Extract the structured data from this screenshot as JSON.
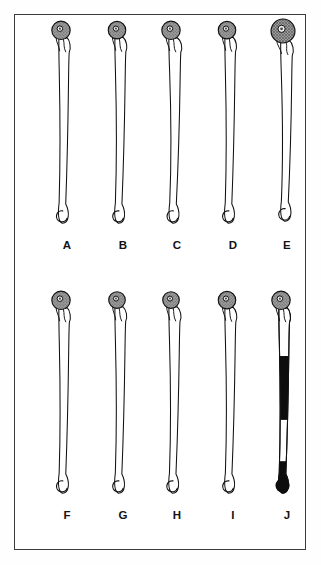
{
  "figure": {
    "kind": "comparative-anatomy-plate",
    "background_color": "#ffffff",
    "frame_color": "#3a3a3a",
    "ink_color": "#111111",
    "head_fill_color": "#9a9a9a",
    "bone_fill_color": "#ffffff",
    "black_fill_color": "#0d0d0d",
    "rows": 2,
    "columns": 5,
    "specimen_count": 10
  },
  "chart_data": {
    "type": "table",
    "title": "",
    "categories": [
      "A",
      "B",
      "C",
      "D",
      "E",
      "F",
      "G",
      "H",
      "I",
      "J"
    ],
    "series": [
      {
        "name": "shaft_length_px",
        "values": [
          196,
          190,
          188,
          192,
          200,
          196,
          192,
          190,
          188,
          196
        ]
      },
      {
        "name": "head_diameter_px",
        "values": [
          19,
          18,
          19,
          18,
          24,
          19,
          17,
          17,
          18,
          19
        ]
      },
      {
        "name": "distal_loop_diameter_px",
        "values": [
          17,
          15,
          16,
          16,
          22,
          17,
          15,
          15,
          17,
          19
        ]
      }
    ],
    "xlabel": "",
    "ylabel": "",
    "legend": []
  },
  "row_top": {
    "specimens": [
      {
        "label": "A",
        "head_style": "stippled",
        "shaft_style": "outline",
        "head_scale": 1.0,
        "curve": 0.35,
        "left": 24
      },
      {
        "label": "B",
        "head_style": "stippled",
        "shaft_style": "outline",
        "head_scale": 0.95,
        "curve": 0.55,
        "left": 80
      },
      {
        "label": "C",
        "head_style": "stippled",
        "shaft_style": "outline",
        "head_scale": 1.0,
        "curve": 0.85,
        "left": 134
      },
      {
        "label": "D",
        "head_style": "stippled",
        "shaft_style": "outline",
        "head_scale": 0.95,
        "curve": 0.45,
        "left": 190
      },
      {
        "label": "E",
        "head_style": "crosshatch",
        "shaft_style": "outline",
        "head_scale": 1.3,
        "curve": 0.7,
        "left": 244
      }
    ]
  },
  "row_bottom": {
    "specimens": [
      {
        "label": "F",
        "head_style": "stippled",
        "shaft_style": "outline",
        "head_scale": 1.0,
        "curve": 0.4,
        "left": 24
      },
      {
        "label": "G",
        "head_style": "stippled",
        "shaft_style": "outline",
        "head_scale": 0.9,
        "curve": 0.5,
        "left": 80
      },
      {
        "label": "H",
        "head_style": "stippled",
        "shaft_style": "outline",
        "head_scale": 0.9,
        "curve": 0.6,
        "left": 134
      },
      {
        "label": "I",
        "head_style": "stippled",
        "shaft_style": "outline",
        "head_scale": 0.95,
        "curve": 0.55,
        "left": 190
      },
      {
        "label": "J",
        "head_style": "stippled",
        "shaft_style": "banded",
        "head_scale": 1.0,
        "curve": 0.45,
        "left": 244
      }
    ]
  },
  "banding": {
    "note": "Specimen J bands from proximal to distal",
    "segments": [
      {
        "fill": "white",
        "from_pct": 0,
        "to_pct": 26
      },
      {
        "fill": "black",
        "from_pct": 26,
        "to_pct": 60
      },
      {
        "fill": "white",
        "from_pct": 60,
        "to_pct": 82
      },
      {
        "fill": "black",
        "from_pct": 82,
        "to_pct": 100
      }
    ]
  }
}
